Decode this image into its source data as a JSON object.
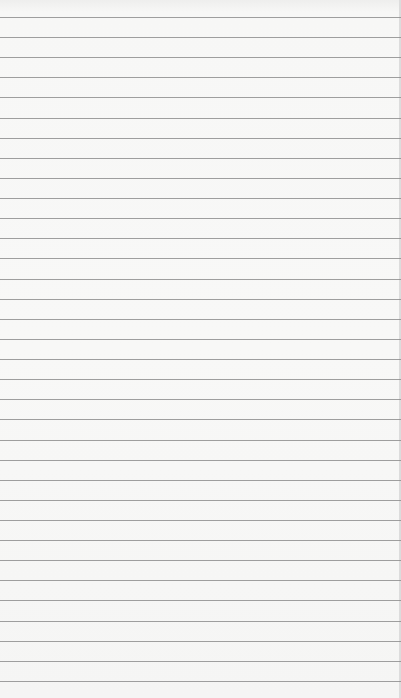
{
  "paper": {
    "type": "ruled-notebook-paper",
    "background_color": "#f7f7f6",
    "line_color": "#8e8e8e",
    "first_line_y": 17,
    "line_spacing": 20.12,
    "line_count": 34,
    "text": ""
  }
}
